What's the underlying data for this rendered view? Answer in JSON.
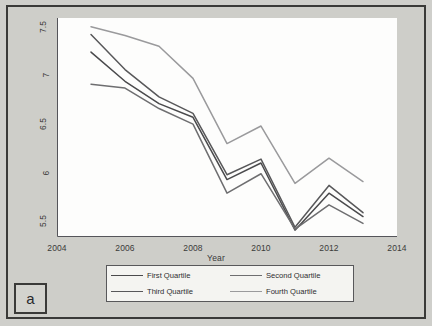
{
  "panel": {
    "letter": "a"
  },
  "chart_data": {
    "type": "line",
    "title": "",
    "xlabel": "Year",
    "ylabel": "CO2 emissions per capita (tons)",
    "xlim": [
      2004,
      2014
    ],
    "ylim": [
      5.35,
      7.6
    ],
    "xticks": [
      "2004",
      "2006",
      "2008",
      "2010",
      "2012",
      "2014"
    ],
    "yticks": [
      "5.5",
      "6",
      "6.5",
      "7",
      "7.5"
    ],
    "grid": false,
    "legend_position": "below-axes",
    "x": [
      2005,
      2006,
      2007,
      2008,
      2009,
      2010,
      2011,
      2012,
      2013
    ],
    "series": [
      {
        "name": "First Quartile",
        "color": "#4a4a4c",
        "values": [
          7.25,
          6.95,
          6.72,
          6.58,
          5.94,
          6.11,
          5.42,
          5.8,
          5.56
        ]
      },
      {
        "name": "Second Quartile",
        "color": "#6e6e70",
        "values": [
          6.92,
          6.88,
          6.67,
          6.51,
          5.8,
          6.0,
          5.43,
          5.68,
          5.49
        ]
      },
      {
        "name": "Third Quartile",
        "color": "#58585a",
        "values": [
          7.43,
          7.07,
          6.79,
          6.62,
          5.99,
          6.15,
          5.45,
          5.88,
          5.6
        ]
      },
      {
        "name": "Fourth Quartile",
        "color": "#9a9a9c",
        "values": [
          7.51,
          7.42,
          7.31,
          6.98,
          6.31,
          6.49,
          5.9,
          6.16,
          5.92
        ]
      }
    ]
  },
  "legend": {
    "entries": [
      {
        "label": "First Quartile"
      },
      {
        "label": "Second Quartile"
      },
      {
        "label": "Third Quartile"
      },
      {
        "label": "Fourth Quartile"
      }
    ]
  }
}
